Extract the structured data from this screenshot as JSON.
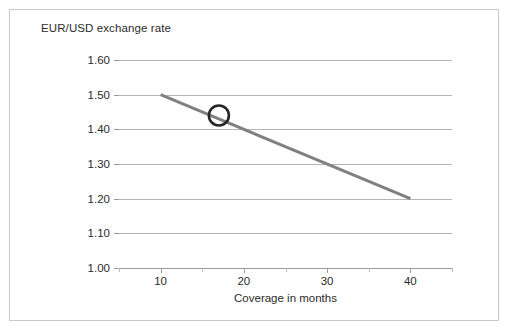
{
  "chart_data": {
    "type": "line",
    "title": "EUR/USD exchange rate",
    "xlabel": "Coverage in months",
    "ylabel": "",
    "xlim": [
      5,
      45
    ],
    "ylim": [
      1.0,
      1.6
    ],
    "grid": true,
    "legend": "none",
    "x_ticks": [
      10,
      20,
      30,
      40
    ],
    "x_tick_labels": [
      "10",
      "20",
      "30",
      "40"
    ],
    "x_minor_ticks": [
      5,
      15,
      25,
      35,
      45
    ],
    "y_ticks": [
      1.0,
      1.1,
      1.2,
      1.3,
      1.4,
      1.5,
      1.6
    ],
    "y_tick_labels": [
      "1.00",
      "1.10",
      "1.20",
      "1.30",
      "1.40",
      "1.50",
      "1.60"
    ],
    "series": [
      {
        "name": "EUR/USD exchange rate",
        "color": "#808080",
        "line_width": 3,
        "x": [
          10,
          40
        ],
        "values": [
          1.5,
          1.2
        ]
      }
    ],
    "annotations": [
      {
        "name": "circle-marker",
        "shape": "open-circle",
        "x": 17,
        "y": 1.44,
        "color": "#262626",
        "radius_px": 10,
        "stroke_width": 2.6
      }
    ],
    "colors": {
      "line": "#808080",
      "grid": "#b5b5b5",
      "axis": "#9a9a9a",
      "text": "#2b2b2b",
      "frame": "#c9c9c9",
      "background": "#ffffff",
      "marker": "#262626"
    }
  }
}
